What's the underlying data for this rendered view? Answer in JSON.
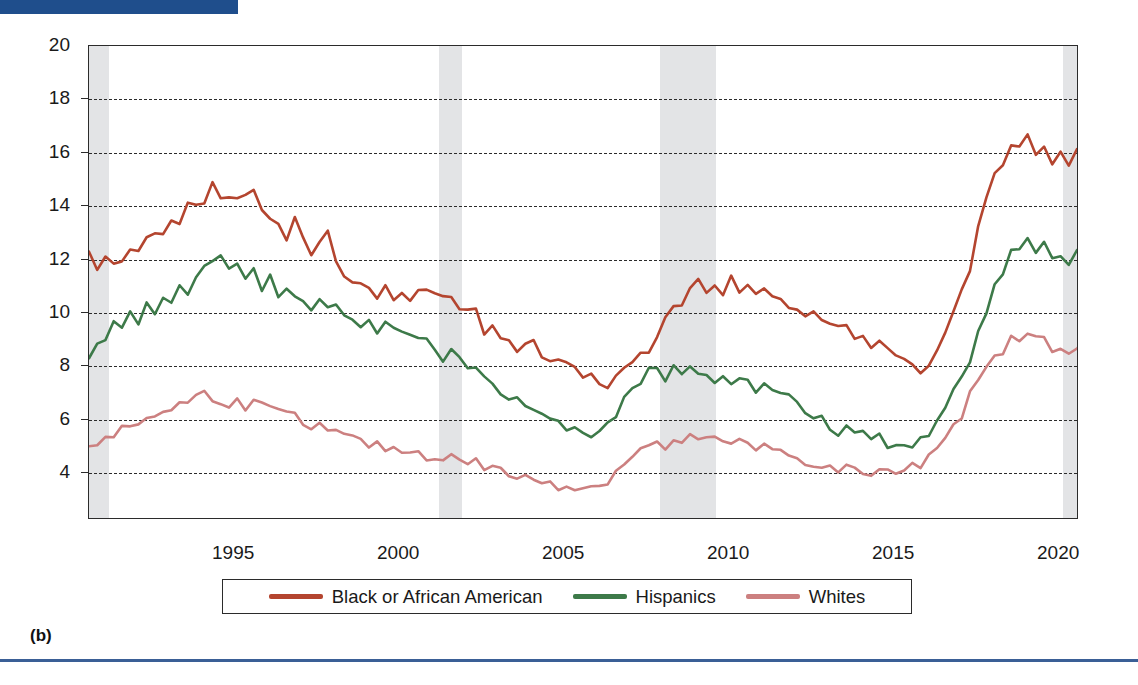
{
  "figure": {
    "panel_label": "(b)",
    "accent_bar_color": "#1f4e8c",
    "rule_color": "#3a5f96"
  },
  "axes": {
    "ylabel": "Percent",
    "yticks": [
      "20",
      "18",
      "16",
      "14",
      "12",
      "10",
      "8",
      "6",
      "4"
    ],
    "ytick_values": [
      20,
      18,
      16,
      14,
      12,
      10,
      8,
      6,
      4
    ],
    "xticks": [
      "1995",
      "2000",
      "2005",
      "2010",
      "2015",
      "2020"
    ],
    "xtick_values": [
      1995,
      2000,
      2005,
      2010,
      2015,
      2020
    ]
  },
  "legend": {
    "items": [
      {
        "label": "Black or African American",
        "color": "#b4452f"
      },
      {
        "label": "Hispanics",
        "color": "#3d7a49"
      },
      {
        "label": "Whites",
        "color": "#cc8080"
      }
    ]
  },
  "chart_data": {
    "type": "line",
    "title": "",
    "xlabel": "",
    "ylabel": "Percent",
    "xlim": [
      1990.6,
      2020.6
    ],
    "ylim": [
      2.24,
      20
    ],
    "grid": true,
    "gridlines_at": [
      18,
      16,
      14,
      12,
      10,
      8,
      6,
      4
    ],
    "legend_position": "bottom",
    "shaded_regions": [
      {
        "label": "recession",
        "x0": 1990.6,
        "x1": 1991.2,
        "color": "#e3e4e6"
      },
      {
        "label": "recession",
        "x0": 2001.2,
        "x1": 2001.9,
        "color": "#e3e4e6"
      },
      {
        "label": "recession",
        "x0": 2007.9,
        "x1": 2009.6,
        "color": "#e3e4e6"
      },
      {
        "label": "recession",
        "x0": 2020.1,
        "x1": 2020.6,
        "color": "#e3e4e6"
      }
    ],
    "x_start": 1990.6,
    "x_step": 0.25,
    "series": [
      {
        "name": "Black or African American",
        "color": "#b4452f",
        "values": [
          12.3,
          11.7,
          12.2,
          12.0,
          11.9,
          12.5,
          12.4,
          12.7,
          13.1,
          13.0,
          13.5,
          13.2,
          14.0,
          13.9,
          14.2,
          14.7,
          14.3,
          14.5,
          14.4,
          14.3,
          14.5,
          14.0,
          13.7,
          13.3,
          12.9,
          13.4,
          12.6,
          12.2,
          12.6,
          13.1,
          11.9,
          11.3,
          11.2,
          10.9,
          11.0,
          10.7,
          10.8,
          10.6,
          10.9,
          10.6,
          10.8,
          10.7,
          10.6,
          10.4,
          10.5,
          10.2,
          10.0,
          9.9,
          9.3,
          9.6,
          9.1,
          8.8,
          8.7,
          8.6,
          8.9,
          8.3,
          8.2,
          8.0,
          7.9,
          7.7,
          7.6,
          7.5,
          7.4,
          7.3,
          7.5,
          7.9,
          8.0,
          8.3,
          8.6,
          9.0,
          9.7,
          10.1,
          10.4,
          10.8,
          11.2,
          10.6,
          11.1,
          10.8,
          11.2,
          10.6,
          10.9,
          10.5,
          10.8,
          10.4,
          10.6,
          10.2,
          10.3,
          9.9,
          10.1,
          9.7,
          9.5,
          9.3,
          9.4,
          9.0,
          9.1,
          8.8,
          9.0,
          8.6,
          8.5,
          8.2,
          8.0,
          7.8,
          7.9,
          8.4,
          9.1,
          9.8,
          10.7,
          11.7,
          13.0,
          14.1,
          15.1,
          15.7,
          16.2,
          16.4,
          16.6,
          16.0,
          16.2,
          15.7,
          16.1,
          15.5,
          15.9,
          16.3,
          15.8,
          16.1,
          15.3,
          15.5,
          14.6,
          14.8,
          14.1,
          14.3,
          13.7,
          13.9,
          13.2,
          13.5,
          12.8,
          12.4,
          12.1,
          11.6,
          11.3,
          11.0,
          10.7,
          10.4,
          10.1,
          9.9,
          9.6,
          9.4,
          9.1,
          8.9,
          8.6,
          8.4,
          8.1,
          7.9,
          7.8,
          7.6,
          7.4,
          7.2,
          7.0,
          6.8,
          6.6,
          6.4,
          6.2,
          6.6,
          7.0,
          6.6,
          6.2,
          6.0,
          5.8,
          5.5,
          5.4,
          5.5,
          16.8,
          15.4,
          13.2,
          11.4
        ],
        "peak_1992": 14.7,
        "peak_2010": 16.6,
        "trough_2019": 5.4,
        "covid_peak_2020": 16.8
      },
      {
        "name": "Hispanics",
        "color": "#3d7a49",
        "values": [
          8.3,
          8.7,
          9.0,
          9.8,
          9.3,
          10.1,
          9.6,
          10.3,
          10.0,
          10.6,
          10.2,
          10.9,
          10.6,
          11.2,
          11.5,
          11.9,
          12.0,
          11.6,
          11.8,
          11.3,
          11.5,
          11.0,
          11.2,
          10.7,
          10.9,
          10.4,
          10.6,
          10.2,
          10.4,
          10.0,
          10.2,
          9.8,
          9.9,
          9.5,
          9.8,
          9.4,
          9.6,
          9.2,
          9.4,
          9.0,
          9.2,
          8.8,
          8.6,
          8.3,
          8.5,
          8.1,
          7.9,
          7.7,
          7.5,
          7.3,
          7.1,
          6.9,
          6.7,
          6.5,
          6.3,
          6.2,
          6.0,
          5.9,
          5.7,
          5.6,
          5.5,
          5.4,
          5.6,
          5.8,
          6.2,
          6.6,
          7.1,
          7.4,
          7.7,
          7.8,
          7.6,
          7.9,
          7.7,
          7.8,
          7.6,
          7.8,
          7.5,
          7.7,
          7.4,
          7.6,
          7.3,
          7.1,
          7.2,
          6.9,
          7.0,
          6.7,
          6.5,
          6.3,
          6.1,
          5.9,
          5.7,
          5.5,
          5.6,
          5.4,
          5.3,
          5.1,
          5.2,
          5.0,
          5.1,
          4.9,
          5.0,
          5.2,
          5.5,
          5.9,
          6.4,
          7.0,
          7.6,
          8.3,
          9.1,
          10.0,
          10.9,
          11.6,
          12.2,
          12.5,
          12.7,
          12.4,
          12.6,
          12.2,
          12.0,
          11.8,
          12.2,
          12.8,
          12.4,
          12.0,
          11.7,
          11.4,
          11.1,
          10.8,
          10.5,
          10.2,
          10.0,
          9.8,
          9.5,
          9.3,
          9.0,
          8.8,
          8.6,
          8.4,
          8.2,
          8.0,
          7.8,
          7.6,
          7.5,
          7.3,
          7.1,
          6.9,
          6.8,
          6.6,
          6.4,
          6.3,
          6.1,
          6.0,
          5.8,
          5.7,
          5.5,
          5.4,
          5.2,
          5.1,
          5.0,
          4.9,
          4.8,
          5.1,
          5.4,
          5.0,
          4.6,
          4.4,
          4.3,
          4.2,
          4.0,
          4.0,
          18.6,
          16.8,
          13.3,
          10.4
        ],
        "peak_1992": 12.0,
        "peak_2010": 12.8,
        "trough_2019": 4.0,
        "covid_peak_2020": 18.6
      },
      {
        "name": "Whites",
        "color": "#cc8080",
        "values": [
          5.0,
          5.1,
          5.3,
          5.4,
          5.5,
          5.7,
          5.8,
          6.0,
          6.1,
          6.3,
          6.4,
          6.5,
          6.6,
          6.8,
          6.9,
          6.8,
          6.7,
          6.6,
          6.6,
          6.5,
          6.5,
          6.4,
          6.3,
          6.2,
          6.1,
          6.0,
          5.9,
          5.8,
          5.7,
          5.6,
          5.4,
          5.3,
          5.2,
          5.1,
          5.0,
          4.9,
          4.9,
          4.8,
          4.8,
          4.7,
          4.7,
          4.6,
          4.6,
          4.5,
          4.5,
          4.4,
          4.4,
          4.3,
          4.2,
          4.1,
          4.0,
          3.9,
          3.8,
          3.7,
          3.7,
          3.6,
          3.6,
          3.5,
          3.5,
          3.4,
          3.4,
          3.4,
          3.5,
          3.7,
          4.0,
          4.3,
          4.6,
          4.8,
          4.9,
          5.0,
          4.9,
          5.1,
          5.0,
          5.2,
          5.1,
          5.3,
          5.1,
          5.2,
          5.0,
          5.1,
          4.9,
          4.8,
          4.9,
          4.7,
          4.8,
          4.6,
          4.5,
          4.4,
          4.3,
          4.2,
          4.1,
          4.0,
          4.1,
          4.0,
          3.9,
          3.9,
          4.0,
          3.9,
          4.0,
          3.9,
          4.1,
          4.3,
          4.6,
          5.0,
          5.4,
          5.8,
          6.2,
          6.8,
          7.3,
          7.8,
          8.2,
          8.6,
          8.9,
          9.0,
          9.1,
          8.9,
          9.0,
          8.7,
          8.8,
          8.5,
          8.6,
          8.8,
          8.5,
          8.3,
          8.1,
          7.9,
          7.7,
          7.5,
          7.3,
          7.2,
          7.0,
          6.9,
          6.7,
          6.6,
          6.4,
          6.3,
          6.1,
          6.0,
          5.8,
          5.7,
          5.6,
          5.5,
          5.4,
          5.3,
          5.2,
          5.1,
          5.0,
          4.9,
          4.8,
          4.7,
          4.6,
          4.5,
          4.4,
          4.4,
          4.3,
          4.2,
          4.1,
          4.0,
          3.9,
          3.8,
          3.7,
          3.8,
          3.9,
          3.7,
          3.4,
          3.3,
          3.2,
          3.1,
          3.0,
          3.0,
          14.8,
          12.8,
          10.2,
          8.0
        ],
        "peak_1992": 6.9,
        "peak_2010": 9.1,
        "trough_2019": 3.0,
        "covid_peak_2020": 14.8
      }
    ]
  }
}
